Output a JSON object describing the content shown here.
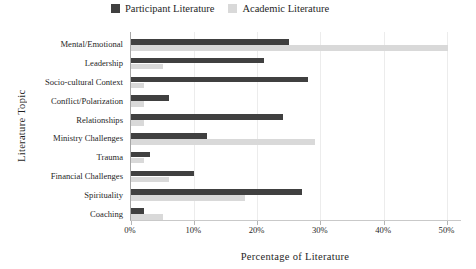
{
  "chart_data": {
    "type": "bar",
    "orientation": "horizontal",
    "title": "",
    "xlabel": "Percentage of Literature",
    "ylabel": "Literature Topic",
    "categories": [
      "Mental/Emotional",
      "Leadership",
      "Socio-cultural Context",
      "Conflict/Polarization",
      "Relationships",
      "Ministry Challenges",
      "Trauma",
      "Financial Challenges",
      "Spirituality",
      "Coaching"
    ],
    "series": [
      {
        "name": "Participant Literature",
        "color": "#404040",
        "values": [
          25,
          21,
          28,
          6,
          24,
          12,
          3,
          10,
          27,
          2
        ]
      },
      {
        "name": "Academic Literature",
        "color": "#d9d9d9",
        "values": [
          50,
          5,
          2,
          2,
          2,
          29,
          2,
          6,
          18,
          5
        ]
      }
    ],
    "xlim": [
      0,
      50
    ],
    "xticks": [
      {
        "label": "0%",
        "value": 0
      },
      {
        "label": "10%",
        "value": 10
      },
      {
        "label": "20%",
        "value": 20
      },
      {
        "label": "30%",
        "value": 30
      },
      {
        "label": "40%",
        "value": 40
      },
      {
        "label": "50%",
        "value": 50
      }
    ],
    "grid": "vertical",
    "legend_position": "top-center"
  },
  "styles": {
    "axis_line_color": "#a6a6a6",
    "gridline_color": "#ececec",
    "text_color": "#1f1f1f",
    "background": "#ffffff"
  }
}
